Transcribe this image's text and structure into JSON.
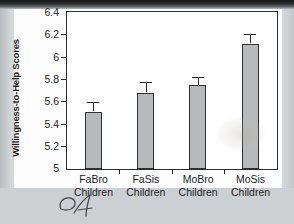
{
  "figure": {
    "background_color": "#fdfdfd",
    "page_color": "#cfd2d4",
    "bar_fill_color": "#b7b9ba",
    "bar_stroke_color": "#2f3133",
    "axis_color": "#2b2d2f",
    "handwriting_note": "handwritten-mark-below-figure"
  },
  "chart_data": {
    "type": "bar",
    "title": "",
    "xlabel": "",
    "ylabel": "Willingness-to-Help Scores",
    "ylim": [
      5,
      6.4
    ],
    "ytick_labels": [
      "5",
      "5.2",
      "5.4",
      "5.6",
      "5.8",
      "6",
      "6.2",
      "6.4"
    ],
    "ytick_values": [
      5,
      5.2,
      5.4,
      5.6,
      5.8,
      6,
      6.2,
      6.4
    ],
    "grid": false,
    "legend": "none",
    "categories": [
      "FaBro Children",
      "FaSis Children",
      "MoBro Children",
      "MoSis Children"
    ],
    "category_lines": [
      [
        "FaBro",
        "Children"
      ],
      [
        "FaSis",
        "Children"
      ],
      [
        "MoBro",
        "Children"
      ],
      [
        "MoSis",
        "Children"
      ]
    ],
    "values": [
      5.51,
      5.68,
      5.75,
      6.12
    ],
    "errors": [
      0.08,
      0.09,
      0.07,
      0.08
    ],
    "error_type": "standard error bars (upper only shown)"
  }
}
